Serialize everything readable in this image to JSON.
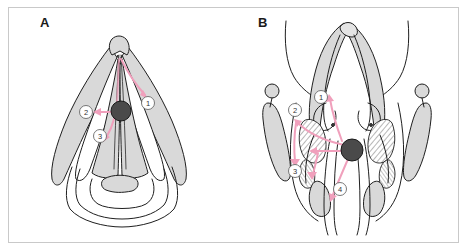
{
  "figure": {
    "panels": [
      {
        "id": "panel-a",
        "letter": "A",
        "view": "endoscopic superior view of larynx",
        "lesion_label": "lesion",
        "callouts": [
          {
            "number": "1",
            "symbol": "①"
          },
          {
            "number": "2",
            "symbol": "②"
          },
          {
            "number": "3",
            "symbol": "③"
          }
        ]
      },
      {
        "id": "panel-b",
        "letter": "B",
        "view": "coronal section of larynx",
        "lesion_label": "lesion",
        "callouts": [
          {
            "number": "1",
            "symbol": "①"
          },
          {
            "number": "2",
            "symbol": "②"
          },
          {
            "number": "3",
            "symbol": "③"
          },
          {
            "number": "4",
            "symbol": "④"
          }
        ]
      }
    ],
    "colors": {
      "background": "#ffffff",
      "frame_border": "#c9c9c9",
      "tissue_fill": "#d9d9d9",
      "tissue_fill_light": "#e4e4e4",
      "outline": "#1f1f1f",
      "lesion": "#4a4a4a",
      "arrow": "#f0a0bc",
      "callout_circle_stroke": "#6a6a6a",
      "callout_text": "#333333",
      "letter_text": "#1a1a1a"
    }
  }
}
